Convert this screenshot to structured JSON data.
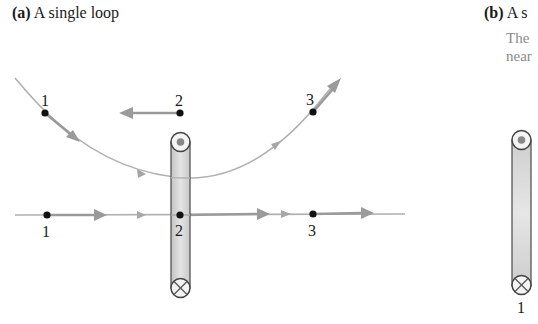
{
  "panel_a": {
    "tag": "(a)",
    "title": "A single loop",
    "curved_path_points": [
      {
        "label": "1",
        "x": 45,
        "y": 113
      },
      {
        "label": "3",
        "x": 313,
        "y": 112
      }
    ],
    "top_point": {
      "label": "2",
      "x": 180,
      "y": 113,
      "arrow_direction": "left"
    },
    "straight_path_points": [
      {
        "label": "1",
        "x": 47,
        "y": 215
      },
      {
        "label": "2",
        "x": 180,
        "y": 215
      },
      {
        "label": "3",
        "x": 313,
        "y": 214
      }
    ],
    "loop": {
      "top_symbol": "current-out-of-page",
      "bottom_symbol": "current-into-page"
    }
  },
  "panel_b": {
    "tag": "(b)",
    "title": "A s",
    "caption_lines": [
      "The",
      "near"
    ],
    "loop": {
      "label": "1",
      "top_symbol": "current-out-of-page",
      "bottom_symbol": "current-into-page"
    }
  },
  "colors": {
    "field_line": "#a8a8a8",
    "arrow": "#9a9a9a",
    "point": "#111111",
    "loop_fill": "#d6d6d6",
    "loop_stroke": "#555555",
    "caption_gray": "#8a8a8a"
  }
}
